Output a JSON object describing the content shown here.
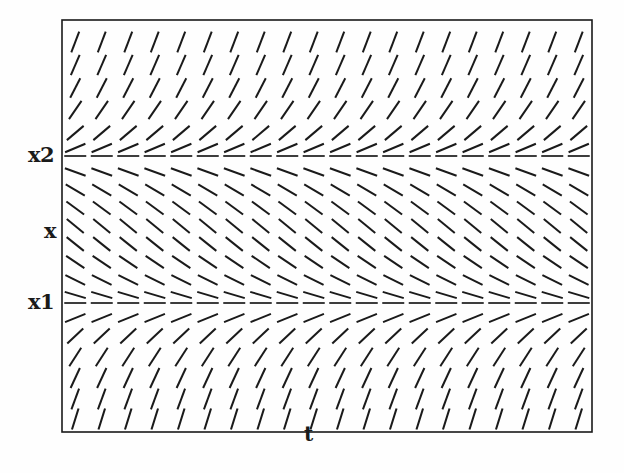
{
  "figure": {
    "kind": "slope-field",
    "background_color": "#fefefe",
    "ink_color": "#1a1a1a"
  },
  "axes": {
    "x_axis_label": "t",
    "y_axis_label": "x",
    "tick_labels": [
      {
        "name": "x2",
        "text": "x2",
        "y_px": 156
      },
      {
        "name": "x",
        "text": "x",
        "y_px": 232
      },
      {
        "name": "x1",
        "text": "x1",
        "y_px": 303
      }
    ],
    "frame": {
      "left": 62,
      "top": 20,
      "right": 592,
      "bottom": 432
    }
  },
  "chart_data": {
    "type": "scatter",
    "title": "",
    "xlabel": "t",
    "ylabel": "x",
    "grid": false,
    "legend": null,
    "plot_box_px": {
      "left": 62,
      "top": 20,
      "right": 592,
      "bottom": 432
    },
    "columns": 20,
    "segment_half_length_px": 11,
    "equilibria": [
      {
        "label": "x2",
        "y_px": 156,
        "slope": 0
      },
      {
        "label": "x1",
        "y_px": 303,
        "slope": 0
      }
    ],
    "reference_marks": [
      {
        "label": "x",
        "y_px": 232
      }
    ],
    "rows": [
      {
        "y_px": 42,
        "slope": 2.6,
        "region": "above-x2"
      },
      {
        "y_px": 65,
        "slope": 2.3,
        "region": "above-x2"
      },
      {
        "y_px": 88,
        "slope": 1.95,
        "region": "above-x2"
      },
      {
        "y_px": 110,
        "slope": 1.45,
        "region": "above-x2"
      },
      {
        "y_px": 133,
        "slope": 0.85,
        "region": "above-x2"
      },
      {
        "y_px": 148,
        "slope": 0.42,
        "region": "above-x2"
      },
      {
        "y_px": 156,
        "slope": 0.0,
        "region": "equilibrium-x2"
      },
      {
        "y_px": 172,
        "slope": -0.36,
        "region": "between"
      },
      {
        "y_px": 190,
        "slope": -0.58,
        "region": "between"
      },
      {
        "y_px": 208,
        "slope": -0.74,
        "region": "between"
      },
      {
        "y_px": 226,
        "slope": -0.82,
        "region": "between"
      },
      {
        "y_px": 244,
        "slope": -0.8,
        "region": "between"
      },
      {
        "y_px": 262,
        "slope": -0.68,
        "region": "between"
      },
      {
        "y_px": 280,
        "slope": -0.5,
        "region": "between"
      },
      {
        "y_px": 295,
        "slope": -0.3,
        "region": "between"
      },
      {
        "y_px": 303,
        "slope": 0.0,
        "region": "equilibrium-x1"
      },
      {
        "y_px": 318,
        "slope": 0.4,
        "region": "below-x1"
      },
      {
        "y_px": 336,
        "slope": 0.95,
        "region": "below-x1"
      },
      {
        "y_px": 357,
        "slope": 1.55,
        "region": "below-x1"
      },
      {
        "y_px": 378,
        "slope": 2.15,
        "region": "below-x1"
      },
      {
        "y_px": 399,
        "slope": 2.7,
        "region": "below-x1"
      },
      {
        "y_px": 419,
        "slope": 3.2,
        "region": "below-x1"
      }
    ],
    "description_regions": [
      {
        "name": "above-x2",
        "slope_sign": "positive",
        "trend": "steepens upward away from x2"
      },
      {
        "name": "between-x1-x2",
        "slope_sign": "negative",
        "trend": "steepest near middle, flattens at both equilibria"
      },
      {
        "name": "below-x1",
        "slope_sign": "positive",
        "trend": "steepens downward away from x1"
      }
    ]
  }
}
